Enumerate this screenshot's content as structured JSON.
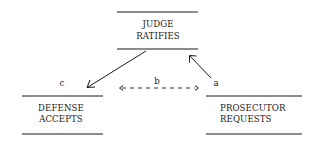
{
  "nodes": {
    "judge": {
      "line1": "JUDGE",
      "line2": "RATIFIES"
    },
    "defense": {
      "line1": "DEFENSE",
      "line2": "ACCEPTS"
    },
    "prosecutor": {
      "line1": "PROSECUTOR",
      "line2": "REQUESTS"
    }
  },
  "edges": {
    "a": {
      "label": "a",
      "from": "prosecutor",
      "to": "judge",
      "style": "solid"
    },
    "b": {
      "label": "b",
      "from": "defense",
      "to": "prosecutor",
      "style": "dashed-bidirectional"
    },
    "c": {
      "label": "c",
      "from": "judge",
      "to": "defense",
      "style": "solid"
    }
  }
}
